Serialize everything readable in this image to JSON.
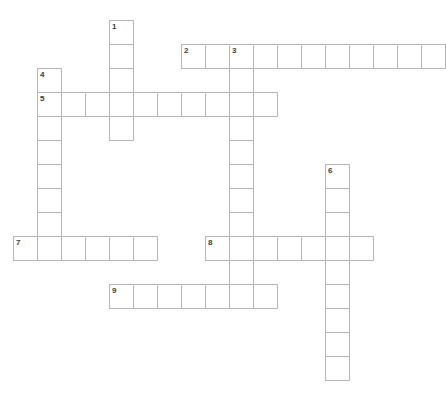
{
  "puzzle": {
    "type": "crossword-grid",
    "title": "Crossword Puzzle Grid",
    "cell_size_px": 24,
    "origin_x_px": 13,
    "origin_y_px": 20,
    "canvas": {
      "width_px": 445,
      "height_px": 393
    },
    "colors": {
      "background": "#ffffff",
      "cell_fill": "#ffffff",
      "cell_border": "#b6b6b6",
      "number_text": "#3c3c3c"
    },
    "entries": [
      {
        "number": "1",
        "direction": "down",
        "start_col": 4,
        "start_row": 0,
        "length": 5,
        "label": "1-down"
      },
      {
        "number": "2",
        "direction": "across",
        "start_col": 7,
        "start_row": 1,
        "length": 11,
        "label": "2-across"
      },
      {
        "number": "3",
        "direction": "down",
        "start_col": 9,
        "start_row": 1,
        "length": 11,
        "label": "3-down"
      },
      {
        "number": "4",
        "direction": "down",
        "start_col": 1,
        "start_row": 2,
        "length": 8,
        "label": "4-down"
      },
      {
        "number": "5",
        "direction": "across",
        "start_col": 1,
        "start_row": 3,
        "length": 10,
        "label": "5-across"
      },
      {
        "number": "6",
        "direction": "down",
        "start_col": 13,
        "start_row": 6,
        "length": 9,
        "label": "6-down"
      },
      {
        "number": "7",
        "direction": "across",
        "start_col": 0,
        "start_row": 9,
        "length": 6,
        "label": "7-across"
      },
      {
        "number": "8",
        "direction": "across",
        "start_col": 8,
        "start_row": 9,
        "length": 7,
        "label": "8-across"
      },
      {
        "number": "9",
        "direction": "across",
        "start_col": 4,
        "start_row": 11,
        "length": 7,
        "label": "9-across"
      }
    ],
    "numbered_cells": [
      {
        "number": "1",
        "col": 4,
        "row": 0
      },
      {
        "number": "2",
        "col": 7,
        "row": 1
      },
      {
        "number": "3",
        "col": 9,
        "row": 1
      },
      {
        "number": "4",
        "col": 1,
        "row": 2
      },
      {
        "number": "5",
        "col": 1,
        "row": 3
      },
      {
        "number": "6",
        "col": 13,
        "row": 6
      },
      {
        "number": "7",
        "col": 0,
        "row": 9
      },
      {
        "number": "8",
        "col": 8,
        "row": 9
      },
      {
        "number": "9",
        "col": 4,
        "row": 11
      }
    ]
  }
}
